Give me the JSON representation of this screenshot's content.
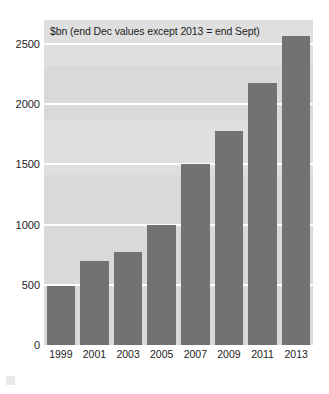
{
  "chart_data": {
    "type": "bar",
    "title": "$bn (end Dec values except 2013 = end Sept)",
    "xlabel": "",
    "ylabel": "",
    "categories": [
      "1999",
      "2001",
      "2003",
      "2005",
      "2007",
      "2009",
      "2011",
      "2013"
    ],
    "values": [
      490,
      700,
      770,
      1000,
      1500,
      1780,
      2180,
      2570
    ],
    "ylim": [
      0,
      2700
    ],
    "yticks": [
      0,
      500,
      1000,
      1500,
      2000,
      2500
    ],
    "ytick_labels": [
      "0",
      "500",
      "1000",
      "1500",
      "2000",
      "2500"
    ],
    "grid": true,
    "legend": false,
    "series": [
      {
        "name": "$bn",
        "values": [
          490,
          700,
          770,
          1000,
          1500,
          1780,
          2180,
          2570
        ]
      }
    ],
    "colors": {
      "bar": "#727272",
      "plot_background": "#d9d9d9",
      "gridline": "#ffffff",
      "text": "#1d1d1d",
      "page_background": "#ffffff"
    }
  }
}
